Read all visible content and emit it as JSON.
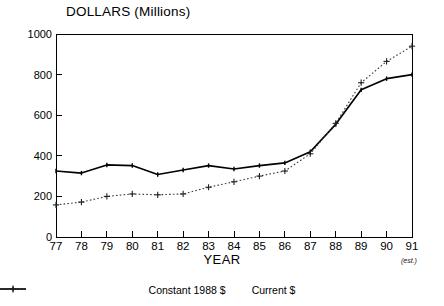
{
  "chart_data": {
    "type": "line",
    "title": "DOLLARS (Millions)",
    "xlabel": "YEAR",
    "ylabel": "",
    "categories": [
      "77",
      "78",
      "79",
      "80",
      "81",
      "82",
      "83",
      "84",
      "85",
      "86",
      "87",
      "88",
      "89",
      "90",
      "91"
    ],
    "x_tick_labels": [
      "77",
      "78",
      "79",
      "80",
      "81",
      "82",
      "83",
      "84",
      "85",
      "86",
      "87",
      "88",
      "89",
      "90",
      "91"
    ],
    "y_tick_labels": [
      "0",
      "200",
      "400",
      "600",
      "800",
      "1000"
    ],
    "y_ticks": [
      0,
      200,
      400,
      600,
      800,
      1000
    ],
    "ylim": [
      0,
      1000
    ],
    "xlim": [
      77,
      91
    ],
    "grid": false,
    "legend_position": "bottom",
    "annotations": [
      "(est.)"
    ],
    "series": [
      {
        "name": "Constant 1988 $",
        "style": "solid",
        "marker": "none",
        "color": "#000000",
        "values": [
          325,
          315,
          355,
          352,
          308,
          330,
          352,
          335,
          352,
          365,
          420,
          555,
          725,
          780,
          800
        ]
      },
      {
        "name": "Current $",
        "style": "dotted",
        "marker": "plus",
        "color": "#333333",
        "values": [
          158,
          172,
          200,
          212,
          208,
          212,
          245,
          272,
          300,
          325,
          410,
          560,
          760,
          865,
          940
        ]
      }
    ]
  },
  "legend": {
    "items": [
      {
        "label": "Constant 1988 $",
        "marker": "solid-line-icon"
      },
      {
        "label": "Current $",
        "marker": "dotted-plus-icon"
      }
    ]
  },
  "notes": {
    "estimate": "(est.)"
  }
}
